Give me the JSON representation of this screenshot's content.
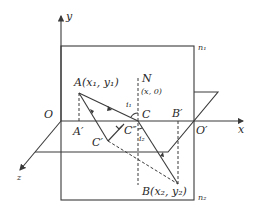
{
  "labels": {
    "y_axis": "y",
    "x_axis": "x",
    "z_axis": "z",
    "origin": "O",
    "origin_prime": "O′",
    "point_A": "A(x₁, y₁)",
    "point_A_prime": "A′",
    "point_N": "N",
    "point_N_coord": "(x, 0)",
    "point_C": "C",
    "point_C_prime": "C′",
    "point_C_double_prime": "C″",
    "point_B": "B(x₂, y₂)",
    "point_B_prime": "B′",
    "angle_i1": "i₁",
    "angle_i2": "i₂",
    "medium_n1": "n₁",
    "medium_n2": "n₂"
  }
}
